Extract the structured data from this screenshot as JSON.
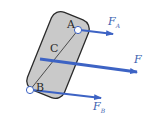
{
  "diagram": {
    "type": "rigid-body-forces",
    "colors": {
      "body_fill": "#c9c9c9",
      "body_stroke": "#2b2b2b",
      "arrow": "#3d63c4",
      "label_text": "#2a2a2a",
      "force_label": "#3a5fb0"
    },
    "points": {
      "A": {
        "label": "A"
      },
      "B": {
        "label": "B"
      },
      "C": {
        "label": "C"
      }
    },
    "forces": {
      "FA": {
        "symbol": "F",
        "subscript": "A"
      },
      "FB": {
        "symbol": "F",
        "subscript": "B"
      },
      "F": {
        "symbol": "F",
        "subscript": ""
      }
    }
  }
}
